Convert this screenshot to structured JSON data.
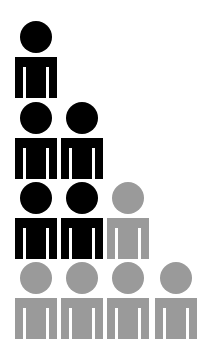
{
  "chart_data": {
    "type": "pictogram",
    "title": "",
    "xlabel": "",
    "ylabel": "",
    "categories": [
      "1",
      "2",
      "3",
      "4"
    ],
    "series": [
      {
        "name": "black",
        "color": "#000000",
        "values": [
          3,
          2,
          0,
          0
        ]
      },
      {
        "name": "gray",
        "color": "#9a9a9a",
        "values": [
          1,
          1,
          2,
          1
        ]
      }
    ],
    "totals": [
      4,
      3,
      2,
      1
    ],
    "icon": "person-icon",
    "grid": false,
    "legend": null,
    "layout": {
      "columns": 4,
      "rows": 4,
      "column_x": [
        15,
        61,
        107,
        155
      ],
      "row_y": [
        21,
        102,
        182,
        262
      ]
    },
    "figures": [
      {
        "col": 0,
        "row": 0,
        "color": "#000000"
      },
      {
        "col": 0,
        "row": 1,
        "color": "#000000"
      },
      {
        "col": 1,
        "row": 1,
        "color": "#000000"
      },
      {
        "col": 0,
        "row": 2,
        "color": "#000000"
      },
      {
        "col": 1,
        "row": 2,
        "color": "#000000"
      },
      {
        "col": 2,
        "row": 2,
        "color": "#9a9a9a"
      },
      {
        "col": 0,
        "row": 3,
        "color": "#9a9a9a"
      },
      {
        "col": 1,
        "row": 3,
        "color": "#9a9a9a"
      },
      {
        "col": 2,
        "row": 3,
        "color": "#9a9a9a"
      },
      {
        "col": 3,
        "row": 3,
        "color": "#9a9a9a"
      }
    ]
  }
}
